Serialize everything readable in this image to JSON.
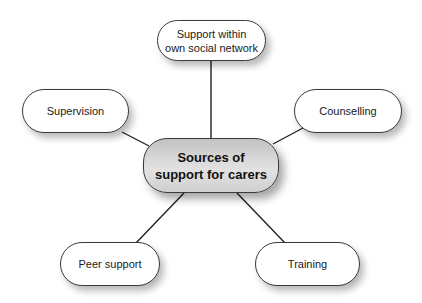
{
  "diagram": {
    "type": "mind-map",
    "center": {
      "label": "Sources of\nsupport for carers",
      "fill": "#d6d6d6"
    },
    "nodes": [
      {
        "id": "social-network",
        "label": "Support within\nown social network"
      },
      {
        "id": "supervision",
        "label": "Supervision"
      },
      {
        "id": "counselling",
        "label": "Counselling"
      },
      {
        "id": "peer-support",
        "label": "Peer support"
      },
      {
        "id": "training",
        "label": "Training"
      }
    ],
    "colors": {
      "border": "#3a3a3a",
      "line": "#222222",
      "node_fill": "#ffffff",
      "text": "#1a1a1a"
    }
  }
}
